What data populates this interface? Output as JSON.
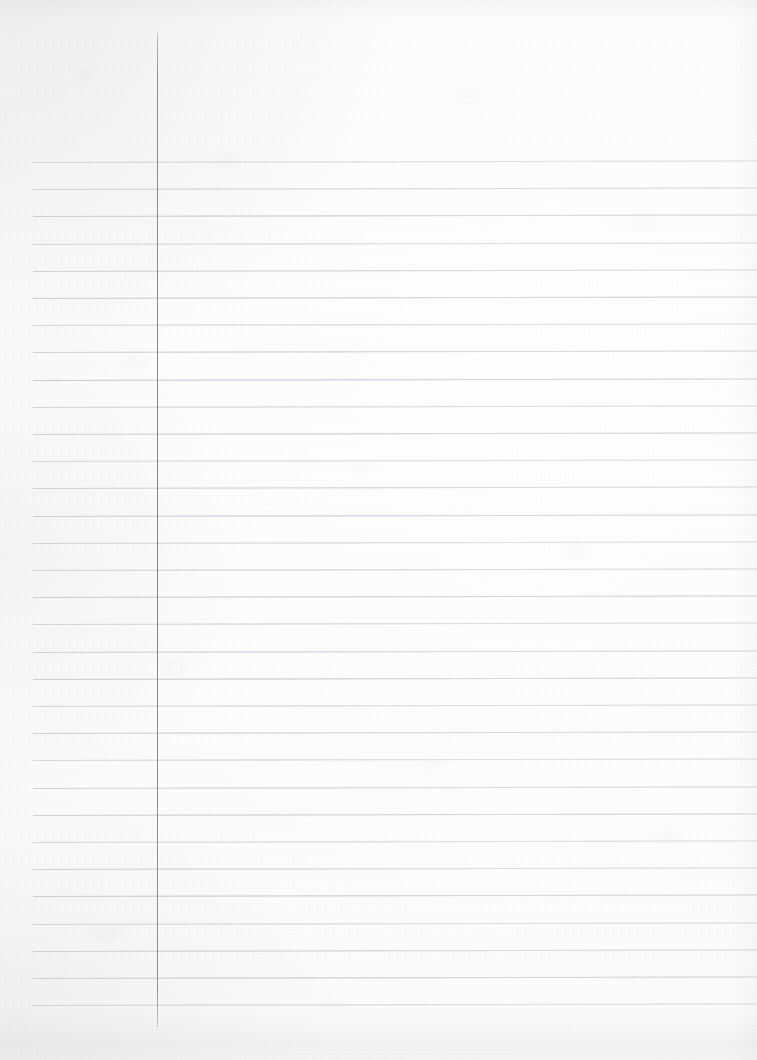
{
  "document": {
    "kind": "scanned-lined-notebook-page",
    "orientation": "portrait",
    "page_width_px": 757,
    "page_height_px": 1060,
    "paper_color": "#fcfcfc",
    "has_visible_text": false,
    "text_content": "",
    "description": "Blank ruled notebook sheet, no handwriting or printed text"
  },
  "ruling": {
    "horizontal_rule_color": "#d6d8dc",
    "horizontal_rule_count": 32,
    "first_rule_y": 162,
    "rule_spacing_px": 27.2,
    "rule_left_x": 33,
    "rule_right_x": 757,
    "rule_thickness_px": 1,
    "rule_skew_deg": -0.12
  },
  "margin": {
    "margin_rule_color": "#84868b",
    "margin_rule_x": 157,
    "margin_rule_top_y": 33,
    "margin_rule_bottom_y": 1027,
    "margin_rule_thickness_px": 1
  },
  "shading": {
    "vignette_color": "#96989c",
    "bottom_band_color": "#96989e",
    "grain_color": "#787a80"
  }
}
